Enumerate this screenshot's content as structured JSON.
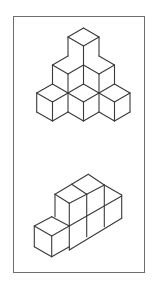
{
  "figure": {
    "frame": {
      "x": 13,
      "y": 16,
      "width": 132,
      "height": 257,
      "border_color": "#6e6e6e"
    },
    "line_color": "#3a3a3a",
    "assemblies": [
      {
        "name": "pyramid",
        "cube_count": 6,
        "rows": [
          1,
          2,
          3
        ],
        "segments": [
          [
            83.5,
            28,
            68,
            37
          ],
          [
            83.5,
            28,
            99,
            37
          ],
          [
            68,
            37,
            83.5,
            46
          ],
          [
            99,
            37,
            83.5,
            46
          ],
          [
            68,
            37,
            68,
            56
          ],
          [
            83.5,
            46,
            83.5,
            65
          ],
          [
            99,
            37,
            99,
            56
          ],
          [
            68,
            56,
            52.5,
            65
          ],
          [
            52.5,
            65,
            68,
            74
          ],
          [
            68,
            74,
            83.5,
            65
          ],
          [
            99,
            56,
            114.5,
            65
          ],
          [
            114.5,
            65,
            99,
            74
          ],
          [
            99,
            74,
            83.5,
            65
          ],
          [
            52.5,
            65,
            52.5,
            84
          ],
          [
            68,
            74,
            68,
            93
          ],
          [
            99,
            74,
            99,
            93
          ],
          [
            114.5,
            65,
            114.5,
            84
          ],
          [
            52.5,
            84,
            36.7,
            93
          ],
          [
            36.7,
            93,
            52.5,
            102
          ],
          [
            52.5,
            102,
            68,
            93
          ],
          [
            68,
            93,
            83.5,
            84
          ],
          [
            83.5,
            84,
            99,
            93
          ],
          [
            68,
            93,
            83.5,
            102
          ],
          [
            83.5,
            102,
            99,
            93
          ],
          [
            99,
            93,
            114.5,
            84
          ],
          [
            114.5,
            84,
            130,
            93
          ],
          [
            130,
            93,
            114.5,
            102
          ],
          [
            114.5,
            102,
            99,
            93
          ],
          [
            36.7,
            93,
            36.7,
            112
          ],
          [
            52.5,
            102,
            52.5,
            121
          ],
          [
            68,
            93,
            68,
            112
          ],
          [
            83.5,
            102,
            83.5,
            121
          ],
          [
            99,
            93,
            99,
            112
          ],
          [
            114.5,
            102,
            114.5,
            121
          ],
          [
            130,
            93,
            130,
            112
          ],
          [
            36.7,
            112,
            52.5,
            121
          ],
          [
            52.5,
            121,
            68,
            112
          ],
          [
            68,
            112,
            83.5,
            121
          ],
          [
            83.5,
            121,
            99,
            112
          ],
          [
            99,
            112,
            114.5,
            121
          ],
          [
            114.5,
            121,
            130,
            112
          ],
          [
            83.5,
            84,
            83.5,
            65
          ],
          [
            52.5,
            84,
            68,
            93
          ]
        ]
      },
      {
        "name": "step-block",
        "cube_count": 6,
        "segments": [
          [
            88.3,
            174.3,
            71.7,
            184.3
          ],
          [
            71.7,
            184.3,
            55,
            194.3
          ],
          [
            88.3,
            174.3,
            104.3,
            185
          ],
          [
            104.3,
            185,
            121.7,
            195
          ],
          [
            71.7,
            184.3,
            86.7,
            194.3
          ],
          [
            55,
            194.3,
            69.3,
            203.3
          ],
          [
            69.3,
            203.3,
            86.7,
            194.3
          ],
          [
            86.7,
            194.3,
            104.3,
            185
          ],
          [
            55,
            194.3,
            55,
            216.7
          ],
          [
            69.3,
            203.3,
            69.3,
            250
          ],
          [
            86.7,
            194.3,
            86.7,
            236.7
          ],
          [
            104.3,
            185,
            104.3,
            226.7
          ],
          [
            121.7,
            195,
            121.7,
            218.3
          ],
          [
            69.3,
            226,
            121.7,
            196
          ],
          [
            69.3,
            250,
            121.7,
            218.3
          ],
          [
            51.7,
            216.7,
            34.3,
            226
          ],
          [
            51.7,
            216.7,
            69.3,
            226
          ],
          [
            34.3,
            226,
            51.7,
            236
          ],
          [
            51.7,
            236,
            69.3,
            226
          ],
          [
            34.3,
            226,
            34.3,
            246.7
          ],
          [
            51.7,
            236,
            51.7,
            256.7
          ],
          [
            34.3,
            246.7,
            51.7,
            256.7
          ],
          [
            51.7,
            256.7,
            69.3,
            246.7
          ]
        ]
      }
    ]
  }
}
